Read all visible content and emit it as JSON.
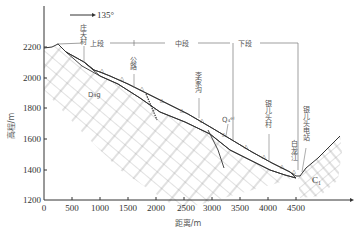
{
  "figure": {
    "direction_label": "135°",
    "y_axis": {
      "label": "高程/m",
      "ticks": [
        "2200",
        "2000",
        "1800",
        "1600",
        "1400",
        "1200"
      ]
    },
    "x_axis": {
      "label": "距离/m",
      "ticks": [
        "0",
        "500",
        "1000",
        "1500",
        "2000",
        "2500",
        "3000",
        "3500",
        "4000",
        "4500"
      ]
    },
    "sections": {
      "upper": "上段",
      "middle": "中段",
      "lower": "下段"
    },
    "places": {
      "zhuangtiancun": "庄天村",
      "gonglu": "公路",
      "lijiagou": "李家沟",
      "yingertoucun": "银儿头村",
      "bailongjiang": "白龙江",
      "dianzhan": "银儿头电站"
    },
    "geo_units": {
      "d": "D₃g",
      "q": "Q₄ᵉˡ",
      "c": "C₁"
    }
  }
}
